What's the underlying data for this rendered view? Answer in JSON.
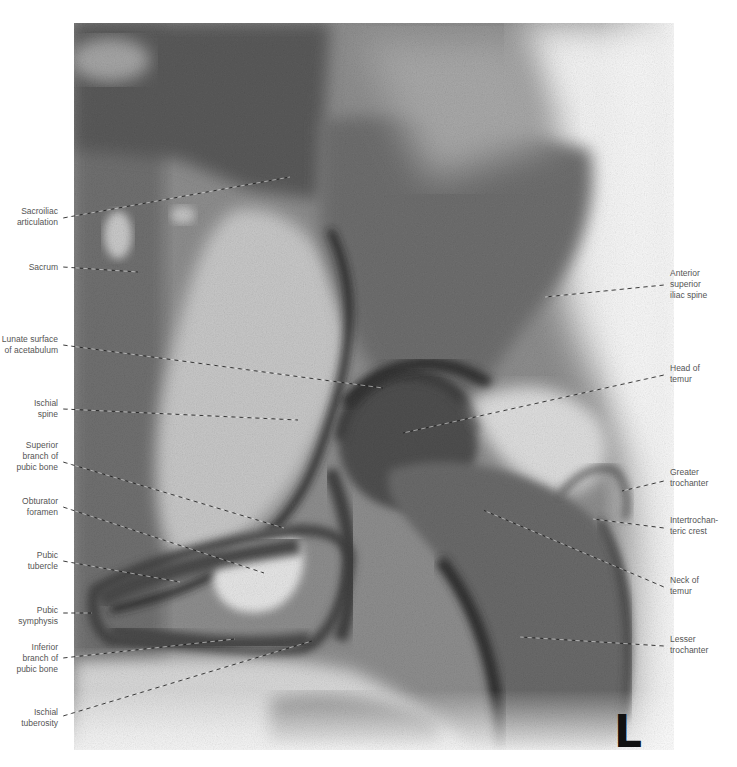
{
  "figure": {
    "side_marker": "L",
    "colors": {
      "paper": "#ffffff",
      "label_text": "#555555",
      "leader_line": "#222222",
      "marker": "#111111"
    }
  },
  "labels": {
    "left": [
      {
        "id": "sacroiliac-articulation",
        "text": "Sacroiliac\narticulation",
        "x": 0,
        "y": 206,
        "w": 58,
        "line": [
          63,
          218,
          290,
          177
        ]
      },
      {
        "id": "sacrum",
        "text": "Sacrum",
        "x": 0,
        "y": 262,
        "w": 58,
        "line": [
          63,
          267,
          138,
          272
        ]
      },
      {
        "id": "lunate-surface-of-acetabulum",
        "text": "Lunate surface\nof acetabulum",
        "x": 0,
        "y": 334,
        "w": 58,
        "line": [
          63,
          345,
          383,
          388
        ]
      },
      {
        "id": "ischial-spine",
        "text": "Ischial\nspine",
        "x": 0,
        "y": 398,
        "w": 58,
        "line": [
          63,
          409,
          298,
          420
        ]
      },
      {
        "id": "superior-branch-of-pubic-bone",
        "text": "Superior\nbranch of\npubic bone",
        "x": 0,
        "y": 440,
        "w": 58,
        "line": [
          63,
          462,
          284,
          528
        ]
      },
      {
        "id": "obturator-foramen",
        "text": "Obturator\nforamen",
        "x": 0,
        "y": 496,
        "w": 58,
        "line": [
          63,
          507,
          264,
          573
        ]
      },
      {
        "id": "pubic-tubercle",
        "text": "Pubic\ntubercle",
        "x": 0,
        "y": 550,
        "w": 58,
        "line": [
          63,
          561,
          180,
          582
        ]
      },
      {
        "id": "pubic-symphysis",
        "text": "Pubic\nsymphysis",
        "x": 0,
        "y": 605,
        "w": 58,
        "line": [
          63,
          613,
          92,
          613
        ]
      },
      {
        "id": "inferior-branch-of-pubic-bone",
        "text": "Inferior\nbranch of\npubic bone",
        "x": 0,
        "y": 642,
        "w": 58,
        "line": [
          63,
          658,
          235,
          639
        ]
      },
      {
        "id": "ischial-tuberosity",
        "text": "Ischial\ntuberosity",
        "x": 0,
        "y": 707,
        "w": 58,
        "line": [
          63,
          716,
          312,
          641
        ]
      }
    ],
    "right": [
      {
        "id": "anterior-superior-iliac-spine",
        "text": "Anterior\nsuperior\niliac spine",
        "x": 670,
        "y": 268,
        "w": 67,
        "line": [
          664,
          285,
          545,
          297
        ]
      },
      {
        "id": "head-of-femur",
        "text": "Head of\ntemur",
        "x": 670,
        "y": 363,
        "w": 67,
        "line": [
          664,
          375,
          403,
          433
        ]
      },
      {
        "id": "greater-trochanter",
        "text": "Greater\ntrochanter",
        "x": 670,
        "y": 467,
        "w": 67,
        "line": [
          664,
          481,
          622,
          491
        ]
      },
      {
        "id": "intertrochanteric-crest",
        "text": "Intertrochan-\nteric crest",
        "x": 670,
        "y": 515,
        "w": 67,
        "line": [
          664,
          528,
          593,
          519
        ]
      },
      {
        "id": "neck-of-femur",
        "text": "Neck of\ntemur",
        "x": 670,
        "y": 575,
        "w": 67,
        "line": [
          664,
          587,
          483,
          510
        ]
      },
      {
        "id": "lesser-trochanter",
        "text": "Lesser\ntrochanter",
        "x": 670,
        "y": 634,
        "w": 67,
        "line": [
          664,
          646,
          520,
          637
        ]
      }
    ]
  }
}
